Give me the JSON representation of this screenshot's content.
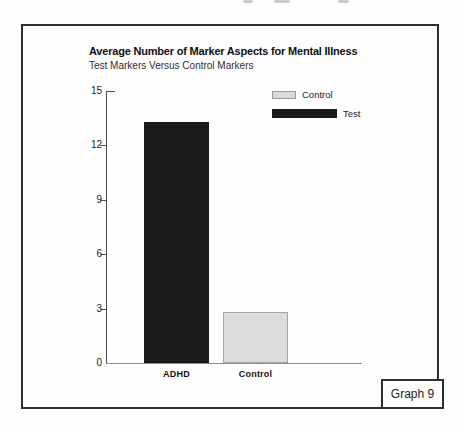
{
  "figure": {
    "title": "Average Number of Marker Aspects for Mental Illness",
    "subtitle": "Test Markers Versus Control Markers",
    "graph_label": "Graph 9"
  },
  "chart_data": {
    "type": "bar",
    "title": "Average Number of Marker Aspects for Mental Illness",
    "subtitle": "Test Markers Versus Control Markers",
    "categories": [
      "ADHD",
      "Control"
    ],
    "values": [
      13.3,
      2.8
    ],
    "bars": [
      {
        "category": "ADHD",
        "value": 13.3,
        "series": "Test",
        "fill": "#1b1b1b",
        "border": "#1b1b1b"
      },
      {
        "category": "Control",
        "value": 2.8,
        "series": "Control",
        "fill": "#dbdbdb",
        "border": "#a6a6a6"
      }
    ],
    "xlabel": "",
    "ylabel": "",
    "ylim": [
      0,
      15
    ],
    "yticks": [
      0,
      3,
      6,
      9,
      12,
      15
    ],
    "grid": false,
    "legend_position": "top-right",
    "legend": [
      {
        "label": "Control",
        "color": "#dbdbdb",
        "border": "#999999",
        "swatch_width": 24,
        "swatch_height": 8
      },
      {
        "label": "Test",
        "color": "#1b1b1b",
        "border": "#1b1b1b",
        "swatch_width": 65,
        "swatch_height": 9
      }
    ]
  }
}
